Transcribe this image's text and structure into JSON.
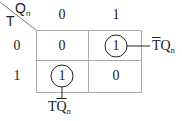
{
  "map": {
    "row_var": "T",
    "col_var": "Q",
    "col_var_sub": "n",
    "col_headers": [
      "0",
      "1"
    ],
    "row_headers": [
      "0",
      "1"
    ],
    "cells": [
      [
        "0",
        "1"
      ],
      [
        "1",
        "0"
      ]
    ],
    "circled": [
      [
        0,
        1
      ],
      [
        1,
        0
      ]
    ]
  },
  "annotations": {
    "right": {
      "bar": "T",
      "rest": "Q",
      "sub": "n"
    },
    "bottom": {
      "plain": "T",
      "bar": "Q",
      "sub": "n"
    }
  },
  "colors": {
    "line": "#999999",
    "text": "#222222"
  }
}
